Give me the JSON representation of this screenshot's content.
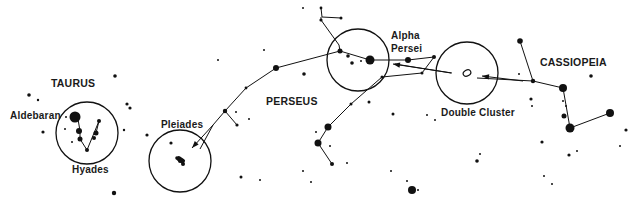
{
  "diagram": {
    "width": 633,
    "height": 205,
    "ink": "#111111",
    "background": "#ffffff",
    "labels": [
      {
        "id": "taurus",
        "text": "TAURUS",
        "x": 51,
        "y": 78
      },
      {
        "id": "aldebaran",
        "text": "Aldebaran",
        "x": 10,
        "y": 110
      },
      {
        "id": "hyades",
        "text": "Hyades",
        "x": 72,
        "y": 164
      },
      {
        "id": "pleiades",
        "text": "Pleiades",
        "x": 161,
        "y": 119
      },
      {
        "id": "perseus",
        "text": "PERSEUS",
        "x": 266,
        "y": 96
      },
      {
        "id": "alpha-persei",
        "text": "Alpha\nPersei",
        "x": 391,
        "y": 29
      },
      {
        "id": "double-cluster",
        "text": "Double Cluster",
        "x": 441,
        "y": 107
      },
      {
        "id": "cassiopeia",
        "text": "CASSIOPEIA",
        "x": 540,
        "y": 57
      }
    ],
    "circles": [
      {
        "id": "hyades-circle",
        "cx": 87,
        "cy": 133,
        "r": 31
      },
      {
        "id": "pleiades-circle",
        "cx": 180,
        "cy": 161,
        "r": 31
      },
      {
        "id": "alpha-persei-circle",
        "cx": 358,
        "cy": 60,
        "r": 31
      },
      {
        "id": "double-cluster-circle",
        "cx": 467,
        "cy": 73,
        "r": 31
      }
    ],
    "lines": [
      {
        "id": "perseus-top",
        "points": [
          [
            321,
            8
          ],
          [
            322,
            17
          ],
          [
            341,
            18
          ]
        ]
      },
      {
        "id": "perseus-neck",
        "points": [
          [
            321,
            17
          ],
          [
            321,
            20
          ],
          [
            339,
            45
          ],
          [
            340,
            51
          ]
        ]
      },
      {
        "id": "perseus-spine",
        "points": [
          [
            340,
            51
          ],
          [
            370,
            60
          ],
          [
            408,
            60
          ],
          [
            434,
            57
          ]
        ]
      },
      {
        "id": "perseus-arc",
        "points": [
          [
            340,
            51
          ],
          [
            276,
            68
          ],
          [
            246,
            88
          ],
          [
            225,
            111
          ],
          [
            213,
            125
          ],
          [
            200,
            149
          ]
        ]
      },
      {
        "id": "perseus-arm",
        "points": [
          [
            225,
            111
          ],
          [
            237,
            125
          ]
        ]
      },
      {
        "id": "perseus-lower",
        "points": [
          [
            382,
            77
          ],
          [
            351,
            104
          ],
          [
            328,
            127
          ],
          [
            318,
            143
          ],
          [
            332,
            164
          ]
        ]
      },
      {
        "id": "alpha-zig",
        "points": [
          [
            382,
            77
          ],
          [
            422,
            73
          ],
          [
            434,
            57
          ]
        ]
      },
      {
        "id": "taurus-v",
        "points": [
          [
            78,
            119
          ],
          [
            80,
            131
          ],
          [
            80,
            139
          ],
          [
            87,
            150
          ],
          [
            99,
            121
          ]
        ]
      },
      {
        "id": "taurus-v2",
        "points": [
          [
            96,
            133
          ],
          [
            99,
            121
          ]
        ]
      },
      {
        "id": "cassiopeia-w",
        "points": [
          [
            520,
            41
          ],
          [
            533,
            81
          ],
          [
            563,
            88
          ],
          [
            570,
            128
          ],
          [
            610,
            113
          ]
        ]
      },
      {
        "id": "double-cluster-link",
        "points": [
          [
            533,
            81
          ],
          [
            477,
            78
          ]
        ]
      },
      {
        "id": "dc-to-alpha",
        "points": [
          [
            451,
            73
          ],
          [
            395,
            64
          ]
        ]
      }
    ],
    "arrows": [
      {
        "id": "to-pleiades",
        "from": [
          213,
          125
        ],
        "to": [
          192,
          148
        ]
      },
      {
        "id": "to-double-cluster",
        "from": [
          523,
          81
        ],
        "to": [
          482,
          76
        ]
      },
      {
        "id": "to-alpha-persei",
        "from": [
          452,
          73
        ],
        "to": [
          393,
          64
        ]
      }
    ],
    "stars": [
      [
        75,
        117,
        5.5
      ],
      [
        79,
        131,
        3
      ],
      [
        80,
        139,
        2.5
      ],
      [
        87,
        150,
        2
      ],
      [
        99,
        121,
        2
      ],
      [
        96,
        133,
        2.5
      ],
      [
        94,
        138,
        2
      ],
      [
        66,
        117,
        1
      ],
      [
        65,
        129,
        1
      ],
      [
        72,
        142,
        1
      ],
      [
        43,
        132,
        1.6
      ],
      [
        29,
        95,
        1.8
      ],
      [
        38,
        100,
        1.2
      ],
      [
        115,
        76,
        1.8
      ],
      [
        127,
        104,
        1.6
      ],
      [
        130,
        108,
        1.6
      ],
      [
        124,
        130,
        1.2
      ],
      [
        147,
        135,
        1.6
      ],
      [
        114,
        193,
        2.2
      ],
      [
        180,
        161,
        2
      ],
      [
        183,
        164,
        2
      ],
      [
        177,
        158,
        1.8
      ],
      [
        225,
        111
      ],
      [
        237,
        125,
        1.6
      ],
      [
        236,
        112,
        1
      ],
      [
        249,
        119,
        1
      ],
      [
        171,
        143,
        1.6
      ],
      [
        241,
        177,
        1.5
      ],
      [
        260,
        180,
        1
      ],
      [
        246,
        88,
        1.4
      ],
      [
        276,
        68,
        3
      ],
      [
        304,
        74,
        1.8
      ],
      [
        218,
        60,
        1
      ],
      [
        264,
        50,
        1
      ],
      [
        321,
        8,
        1.4
      ],
      [
        341,
        18,
        1.5
      ],
      [
        321,
        20,
        1.6
      ],
      [
        303,
        8,
        1
      ],
      [
        277,
        7,
        0
      ],
      [
        340,
        51,
        2.5
      ],
      [
        348,
        56,
        1.8
      ],
      [
        352,
        63,
        1.8
      ],
      [
        361,
        61,
        1
      ],
      [
        370,
        60,
        4.5
      ],
      [
        408,
        60,
        3
      ],
      [
        434,
        57,
        2
      ],
      [
        382,
        77,
        1.5
      ],
      [
        351,
        104,
        1.5
      ],
      [
        328,
        127,
        3.5
      ],
      [
        318,
        143,
        3.5
      ],
      [
        332,
        164,
        2
      ],
      [
        316,
        132,
        1
      ],
      [
        330,
        146,
        1
      ],
      [
        347,
        163,
        1
      ],
      [
        303,
        171,
        1
      ],
      [
        311,
        182,
        1
      ],
      [
        369,
        102,
        1.5
      ],
      [
        391,
        171,
        1
      ],
      [
        412,
        190,
        4
      ],
      [
        427,
        115,
        1
      ],
      [
        422,
        73,
        1.5
      ],
      [
        399,
        64,
        1
      ],
      [
        393,
        114,
        1.5
      ],
      [
        435,
        120,
        1
      ],
      [
        475,
        107,
        0
      ],
      [
        520,
        41,
        2.8
      ],
      [
        533,
        81,
        2.2
      ],
      [
        563,
        88,
        4
      ],
      [
        570,
        128,
        4.5
      ],
      [
        610,
        113,
        4
      ],
      [
        564,
        116,
        2.5
      ],
      [
        591,
        76,
        1.8
      ],
      [
        563,
        101,
        1
      ],
      [
        566,
        106,
        1
      ],
      [
        531,
        99,
        1.6
      ],
      [
        519,
        74,
        1
      ],
      [
        626,
        130,
        1.6
      ],
      [
        620,
        146,
        1
      ],
      [
        569,
        155,
        1.6
      ],
      [
        577,
        151,
        1
      ],
      [
        544,
        176,
        1
      ],
      [
        552,
        184,
        1
      ],
      [
        542,
        142,
        1.6
      ],
      [
        532,
        106,
        1
      ],
      [
        477,
        161,
        1.8
      ],
      [
        480,
        154,
        1
      ],
      [
        407,
        181,
        1
      ],
      [
        418,
        190,
        1
      ]
    ],
    "double_cluster_mark": {
      "cx": 467,
      "cy": 73,
      "rx": 4,
      "ry": 3
    }
  }
}
